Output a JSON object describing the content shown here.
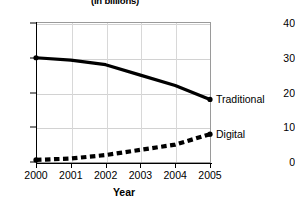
{
  "chart_data": {
    "type": "line",
    "title": "(in billions)",
    "xlabel": "Year",
    "ylabel": "",
    "categories": [
      "2000",
      "2001",
      "2002",
      "2003",
      "2004",
      "2005"
    ],
    "x": [
      2000,
      2001,
      2002,
      2003,
      2004,
      2005
    ],
    "xlim": [
      2000,
      2005
    ],
    "ylim": [
      0,
      40
    ],
    "yticks": [
      0,
      10,
      20,
      30,
      40
    ],
    "ytick_labels": [
      "0",
      "10",
      "20",
      "30",
      "40"
    ],
    "grid": true,
    "legend_position": "inline-right",
    "series": [
      {
        "name": "Traditional",
        "style": "solid",
        "color": "#000000",
        "values": [
          30,
          29.3,
          28,
          25,
          22,
          18
        ]
      },
      {
        "name": "Digital",
        "style": "dashed",
        "color": "#000000",
        "values": [
          0.6,
          1,
          2,
          3.5,
          5,
          8
        ]
      }
    ]
  },
  "annotations": {
    "traditional_label": "Traditional",
    "digital_label": "Digital"
  }
}
